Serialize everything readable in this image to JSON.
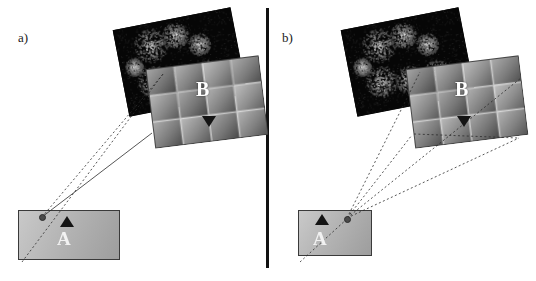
{
  "figure": {
    "panels": [
      {
        "id": "a",
        "label": "a)",
        "micrograph": {
          "x": 120,
          "y": 18,
          "width": 120,
          "height": 88,
          "rotation": -11,
          "description": "dark fluorescence micrograph with bright particle clusters"
        },
        "mosaic": {
          "x": 150,
          "y": 62,
          "width": 114,
          "height": 80,
          "rotation": -7,
          "cols": 4,
          "rows": 3,
          "description": "grayscale tile mosaic of magnified region"
        },
        "mosaic_marker": {
          "label": "B",
          "arrow": "triangle-down"
        },
        "slab": {
          "x": 18,
          "y": 210,
          "width": 100,
          "height": 48,
          "description": "grey sample slab"
        },
        "slab_marker": {
          "label": "A",
          "arrow": "triangle-up"
        },
        "probe_dot": true,
        "projection_lines": 2
      },
      {
        "id": "b",
        "label": "b)",
        "micrograph": {
          "x": 348,
          "y": 18,
          "width": 120,
          "height": 88,
          "rotation": -11,
          "description": "dark fluorescence micrograph with bright particle clusters"
        },
        "mosaic": {
          "x": 410,
          "y": 62,
          "width": 114,
          "height": 80,
          "rotation": -7,
          "cols": 4,
          "rows": 3,
          "description": "grayscale tile mosaic of magnified region"
        },
        "mosaic_marker": {
          "label": "B",
          "arrow": "triangle-down"
        },
        "slab": {
          "x": 298,
          "y": 210,
          "width": 72,
          "height": 44,
          "description": "grey sample slab"
        },
        "slab_marker": {
          "label": "A",
          "arrow": "triangle-up"
        },
        "probe_dot": true,
        "projection_lines": 3
      }
    ],
    "divider": {
      "x": 266,
      "y": 8,
      "width": 3,
      "height": 260,
      "color": "#111111"
    },
    "colors": {
      "background": "#ffffff",
      "micrograph_bg": "#050505",
      "line": "#2b2b2b",
      "label": "#1a1a1a",
      "marker_text": "#ffffff"
    }
  }
}
